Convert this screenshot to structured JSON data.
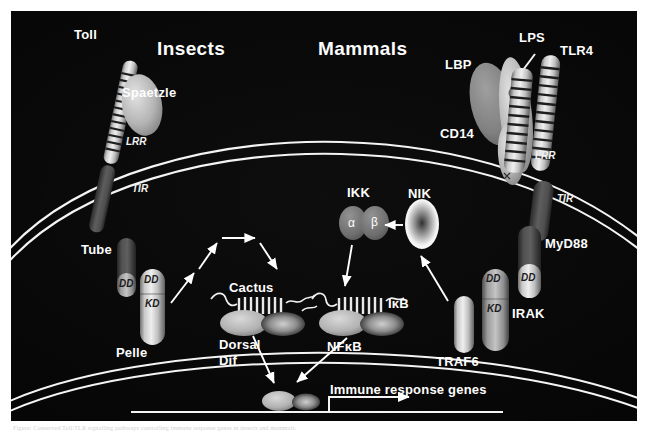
{
  "figure": {
    "panel_bg": "#050505",
    "label_color": "#fdfdfd",
    "caption": "Figure: Conserved Toll/TLR signalling pathways controlling immune response genes in insects and mammals."
  },
  "sections": {
    "left_title": "Insects",
    "right_title": "Mammals"
  },
  "insect_pathway": {
    "receptor": "Toll",
    "ligand": "Spaetzle",
    "ectodomain": "LRR",
    "cytodomain": "TIR",
    "adaptor": "Tube",
    "adaptor_domain": "DD",
    "kinase": "Pelle",
    "kinase_domain_dd": "DD",
    "kinase_domain_kd": "KD",
    "inhibitor": "Cactus",
    "transcription_factor_line1": "Dorsal",
    "transcription_factor_line2": "Dif"
  },
  "mammal_pathway": {
    "ligand": "LPS",
    "binding_protein": "LBP",
    "receptor": "TLR4",
    "coreceptor": "CD14",
    "ectodomain": "LRR",
    "cytodomain": "TIR",
    "adaptor": "MyD88",
    "adaptor_domain": "DD",
    "kinase": "IRAK",
    "kinase_domain_dd": "DD",
    "kinase_domain_kd": "KD",
    "ubiquitin_ligase": "TRAF6",
    "map3k": "NIK",
    "kinase_complex": "IKK",
    "ikk_subunit_alpha": "α",
    "ikk_subunit_beta": "β",
    "inhibitor": "IκB",
    "transcription_factor": "NFκB"
  },
  "nucleus": {
    "gene_label": "Immune response genes"
  }
}
